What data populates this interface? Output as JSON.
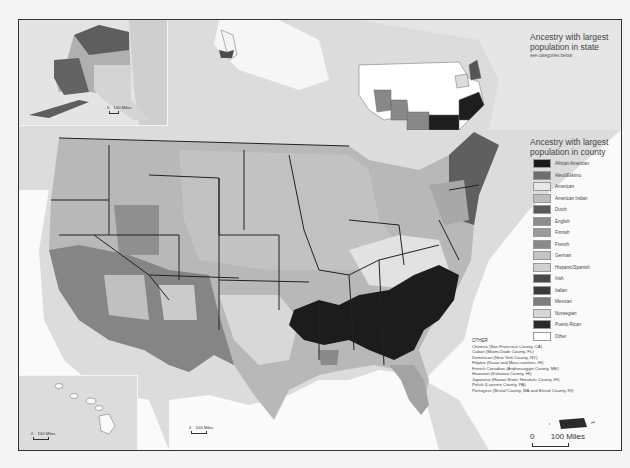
{
  "map": {
    "state_inset": {
      "title": "Ancestry with largest population in state",
      "title_line1": "Ancestry with largest",
      "title_line2": "population in state",
      "subtitle": "see categories below"
    },
    "county_legend": {
      "title_line1": "Ancestry with largest",
      "title_line2": "population in county",
      "items": [
        {
          "label": "African American",
          "color": "#1a1a1a"
        },
        {
          "label": "Aleut/Eskimo",
          "color": "#6e6e6e"
        },
        {
          "label": "American",
          "color": "#e8e8e8"
        },
        {
          "label": "American Indian",
          "color": "#bdbdbd"
        },
        {
          "label": "Dutch",
          "color": "#5a5a5a"
        },
        {
          "label": "English",
          "color": "#8c8c8c"
        },
        {
          "label": "Finnish",
          "color": "#9a9a9a"
        },
        {
          "label": "French",
          "color": "#8a8a8a"
        },
        {
          "label": "German",
          "color": "#c4c4c4"
        },
        {
          "label": "Hispanic/Spanish",
          "color": "#cfcfcf"
        },
        {
          "label": "Irish",
          "color": "#4a4a4a"
        },
        {
          "label": "Italian",
          "color": "#3a3a3a"
        },
        {
          "label": "Mexican",
          "color": "#7d7d7d"
        },
        {
          "label": "Norwegian",
          "color": "#d6d6d6"
        },
        {
          "label": "Puerto Rican",
          "color": "#2b2b2b"
        },
        {
          "label": "Other",
          "color": "#ffffff"
        }
      ]
    },
    "other": {
      "heading": "OTHER",
      "items": [
        "Chinese (San Francisco County, CA)",
        "Cuban (Miami-Dade County, FL)",
        "Dominican (New York County, NY)",
        "Filipino (Kauai and Maui counties, HI)",
        "French Canadian (Androscoggin County, ME)",
        "Hawaiian (Kalawao County, HI)",
        "Japanese (Hawaii State; Honolulu County, HI)",
        "Polish (Luzerne County, PA)",
        "Portugese (Bristol County, MA and Bristol County, RI)"
      ]
    },
    "scales": {
      "alaska": {
        "zero": "0",
        "label": "100 Miles"
      },
      "hawaii": {
        "zero": "0",
        "label": "100 Miles"
      },
      "main": {
        "zero": "0",
        "label": "100 Miles"
      },
      "puerto_rico": {
        "zero": "0",
        "label": "100 Miles"
      }
    }
  }
}
